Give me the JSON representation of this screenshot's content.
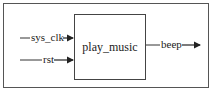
{
  "diagram": {
    "type": "block-diagram",
    "module": {
      "name": "play_music"
    },
    "inputs": [
      {
        "name": "sys_clk"
      },
      {
        "name": "rst"
      }
    ],
    "outputs": [
      {
        "name": "beep"
      }
    ],
    "colors": {
      "line": "#333333",
      "text": "#222222",
      "background": "#ffffff"
    }
  }
}
